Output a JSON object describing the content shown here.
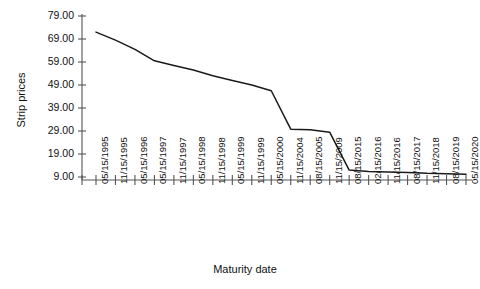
{
  "chart_data": {
    "type": "line",
    "title": "",
    "xlabel": "Maturity date",
    "ylabel": "Strip prices",
    "ylim": [
      9.0,
      79.0
    ],
    "ytick_values": [
      9.0,
      19.0,
      29.0,
      39.0,
      49.0,
      59.0,
      69.0,
      79.0
    ],
    "ytick_labels": [
      "9.00",
      "19.00",
      "29.00",
      "39.00",
      "49.00",
      "59.00",
      "69.00",
      "79.00"
    ],
    "grid": false,
    "legend": "none",
    "categories": [
      "05/15/1995",
      "11/15/1995",
      "05/15/1996",
      "05/15/1997",
      "11/15/1997",
      "05/15/1998",
      "11/15/1998",
      "05/15/1999",
      "11/15/1999",
      "05/15/2000",
      "11/15/2004",
      "08/15/2005",
      "11/15/2009",
      "08/15/2015",
      "02/15/2016",
      "11/15/2016",
      "08/15/2017",
      "11/15/2018",
      "08/15/2019",
      "05/15/2020"
    ],
    "values": [
      72.0,
      68.5,
      64.5,
      59.5,
      57.5,
      55.5,
      53.0,
      51.0,
      49.0,
      46.5,
      29.8,
      29.5,
      28.5,
      12.0,
      11.4,
      11.2,
      11.0,
      10.6,
      10.4,
      10.2
    ],
    "series": [
      {
        "name": "Strip prices",
        "values": [
          72.0,
          68.5,
          64.5,
          59.5,
          57.5,
          55.5,
          53.0,
          51.0,
          49.0,
          46.5,
          29.8,
          29.5,
          28.5,
          12.0,
          11.4,
          11.2,
          11.0,
          10.6,
          10.4,
          10.2
        ]
      }
    ],
    "line_color": "#1a1a1a",
    "axis_color": "#555555"
  },
  "chart": {
    "title_faint": "",
    "x_axis_title": "Maturity date",
    "y_axis_title": "Strip prices"
  }
}
